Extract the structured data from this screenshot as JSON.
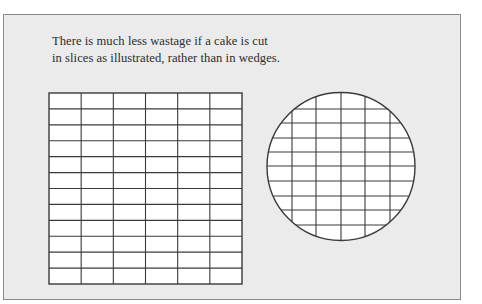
{
  "caption": {
    "line1": "There is much less wastage if a cake is cut",
    "line2": "in slices as illustrated, rather than in wedges."
  },
  "colors": {
    "panel_background": "#ebebeb",
    "panel_border": "#8a8a8a",
    "cake_fill": "#ffffff",
    "line": "#3a3a3a",
    "text": "#2e2e2e"
  },
  "square_cake": {
    "x": 49,
    "y": 93,
    "width": 193,
    "height": 191,
    "columns": 6,
    "rows": 12
  },
  "round_cake": {
    "cx": 341,
    "cy": 166.5,
    "r": 74,
    "vertical_lines_x": [
      292,
      316,
      341,
      365,
      390
    ],
    "horizontal_lines_y": [
      109,
      123,
      138,
      152,
      166,
      181,
      196,
      210,
      225
    ]
  }
}
